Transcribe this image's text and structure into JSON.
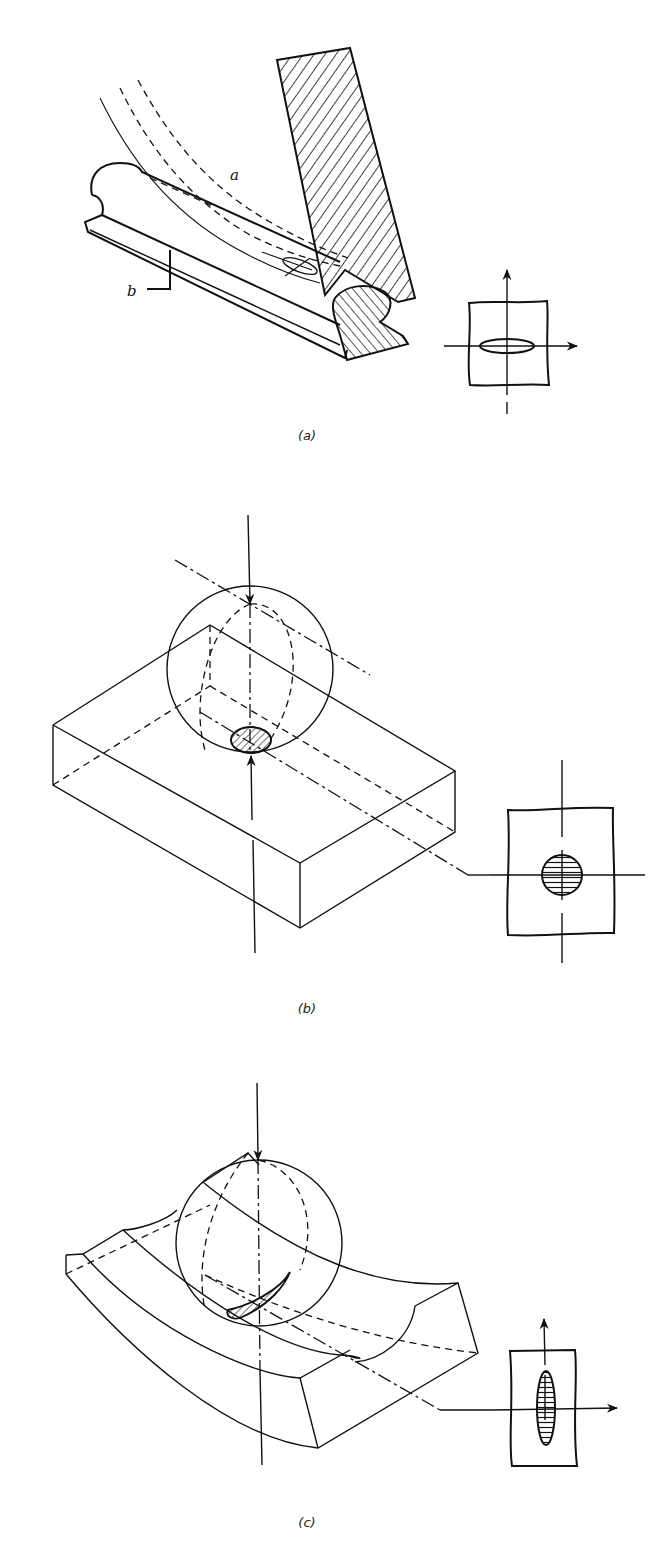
{
  "figure": {
    "panels": [
      {
        "id": "a",
        "caption": "(a)",
        "labels": {
          "a": "a",
          "b": "b"
        },
        "description": "Grinding wheel contacting a rail profile; elliptical contact area shown in inset with orthogonal axes"
      },
      {
        "id": "b",
        "caption": "(b)",
        "description": "Sphere pressed on flat block; circular contact area shown in inset"
      },
      {
        "id": "c",
        "caption": "(c)",
        "description": "Sphere in curved groove; elongated elliptical contact area shown in inset"
      }
    ]
  },
  "colors": {
    "ink": "#111111",
    "background": "#ffffff"
  }
}
